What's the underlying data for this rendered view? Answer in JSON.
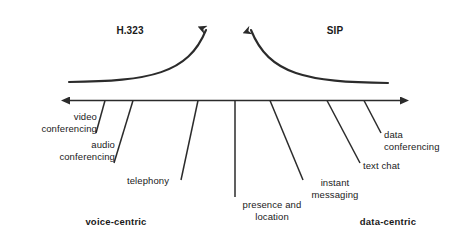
{
  "diagram": {
    "type": "spectrum-axis-diagram",
    "colors": {
      "stroke": "#2b2b2b",
      "text": "#1a1a1a",
      "background": "#ffffff"
    },
    "protocols": [
      {
        "id": "h323",
        "label": "H.323",
        "side": "left"
      },
      {
        "id": "sip",
        "label": "SIP",
        "side": "right"
      }
    ],
    "axis": {
      "left_end_label": "voice-centric",
      "right_end_label": "data-centric",
      "double_headed": true
    },
    "services": [
      {
        "id": "video-conferencing",
        "label": "video\nconferencing",
        "align": "right"
      },
      {
        "id": "audio-conferencing",
        "label": "audio\nconferencing",
        "align": "right"
      },
      {
        "id": "telephony",
        "label": "telephony",
        "align": "center"
      },
      {
        "id": "presence-location",
        "label": "presence and\nlocation",
        "align": "center"
      },
      {
        "id": "instant-messaging",
        "label": "instant\nmessaging",
        "align": "center"
      },
      {
        "id": "text-chat",
        "label": "text chat",
        "align": "left"
      },
      {
        "id": "data-conferencing",
        "label": "data\nconferencing",
        "align": "left"
      }
    ]
  }
}
